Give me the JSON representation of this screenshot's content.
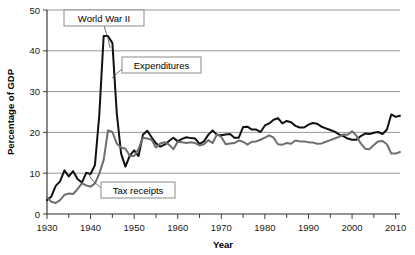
{
  "chart_data": {
    "type": "line",
    "title": "",
    "xlabel": "Year",
    "ylabel": "Percentage of GDP",
    "xlim": [
      1930,
      2011
    ],
    "ylim": [
      0,
      50
    ],
    "grid": true,
    "legend_position": "inline-annotations",
    "x_ticks_labeled": [
      1930,
      1940,
      1950,
      1960,
      1970,
      1980,
      1990,
      2000,
      2010
    ],
    "x_tick_labels": [
      "1930",
      "1940",
      "1950",
      "1960",
      "1970",
      "1980",
      "1990",
      "2000",
      "2010"
    ],
    "x_minor_ticks": [
      1935,
      1945,
      1955,
      1965,
      1975,
      1985,
      1995,
      2005
    ],
    "y_ticks": [
      0,
      10,
      20,
      30,
      40,
      50
    ],
    "y_tick_labels": [
      "0",
      "10",
      "20",
      "30",
      "40",
      "50"
    ],
    "annotations": [
      {
        "name": "world-war-ii",
        "text": "World War II",
        "box_x": 64,
        "box_y": 10,
        "box_w": 80,
        "box_h": 16,
        "leader": "M 104 26 L 108 38 L 110 48"
      },
      {
        "name": "expenditures",
        "text": "Expenditures",
        "box_x": 122,
        "box_y": 57,
        "box_w": 79,
        "box_h": 16,
        "leader": "M 122 69 L 112 78"
      },
      {
        "name": "tax-receipts",
        "text": "Tax receipts",
        "box_x": 101,
        "box_y": 182,
        "box_w": 74,
        "box_h": 16,
        "leader": "M 101 188 L 92 180 L 88 173"
      }
    ],
    "series": [
      {
        "name": "Expenditures",
        "color": "#111111",
        "width": 2.0,
        "x": [
          1930,
          1931,
          1932,
          1933,
          1934,
          1935,
          1936,
          1937,
          1938,
          1939,
          1940,
          1941,
          1942,
          1943,
          1944,
          1945,
          1946,
          1947,
          1948,
          1949,
          1950,
          1951,
          1952,
          1953,
          1954,
          1955,
          1956,
          1957,
          1958,
          1959,
          1960,
          1961,
          1962,
          1963,
          1964,
          1965,
          1966,
          1967,
          1968,
          1969,
          1970,
          1971,
          1972,
          1973,
          1974,
          1975,
          1976,
          1977,
          1978,
          1979,
          1980,
          1981,
          1982,
          1983,
          1984,
          1985,
          1986,
          1987,
          1988,
          1989,
          1990,
          1991,
          1992,
          1993,
          1994,
          1995,
          1996,
          1997,
          1998,
          1999,
          2000,
          2001,
          2002,
          2003,
          2004,
          2005,
          2006,
          2007,
          2008,
          2009,
          2010,
          2011
        ],
        "values": [
          3.4,
          4.3,
          6.9,
          8.0,
          10.7,
          9.2,
          10.5,
          8.6,
          7.7,
          10.1,
          9.8,
          12.0,
          24.3,
          43.6,
          43.6,
          41.9,
          24.8,
          14.8,
          11.6,
          14.3,
          15.6,
          14.2,
          19.4,
          20.4,
          18.8,
          17.3,
          16.5,
          17.0,
          17.9,
          18.7,
          17.8,
          18.4,
          18.8,
          18.6,
          18.5,
          17.2,
          17.8,
          19.4,
          20.5,
          19.4,
          19.3,
          19.5,
          19.6,
          18.7,
          18.7,
          21.3,
          21.4,
          20.7,
          20.7,
          20.1,
          21.7,
          22.2,
          23.1,
          23.5,
          22.2,
          22.8,
          22.5,
          21.6,
          21.2,
          21.2,
          21.9,
          22.3,
          22.1,
          21.4,
          21.0,
          20.6,
          20.2,
          19.5,
          19.1,
          18.5,
          18.2,
          18.2,
          19.1,
          19.7,
          19.6,
          19.9,
          20.1,
          19.6,
          20.7,
          24.4,
          23.8,
          24.1
        ]
      },
      {
        "name": "Tax receipts",
        "color": "#6e6e6e",
        "width": 2.0,
        "x": [
          1930,
          1931,
          1932,
          1933,
          1934,
          1935,
          1936,
          1937,
          1938,
          1939,
          1940,
          1941,
          1942,
          1943,
          1944,
          1945,
          1946,
          1947,
          1948,
          1949,
          1950,
          1951,
          1952,
          1953,
          1954,
          1955,
          1956,
          1957,
          1958,
          1959,
          1960,
          1961,
          1962,
          1963,
          1964,
          1965,
          1966,
          1967,
          1968,
          1969,
          1970,
          1971,
          1972,
          1973,
          1974,
          1975,
          1976,
          1977,
          1978,
          1979,
          1980,
          1981,
          1982,
          1983,
          1984,
          1985,
          1986,
          1987,
          1988,
          1989,
          1990,
          1991,
          1992,
          1993,
          1994,
          1995,
          1996,
          1997,
          1998,
          1999,
          2000,
          2001,
          2002,
          2003,
          2004,
          2005,
          2006,
          2007,
          2008,
          2009,
          2010,
          2011
        ],
        "values": [
          4.1,
          3.0,
          2.7,
          3.4,
          4.7,
          5.0,
          4.9,
          6.1,
          7.5,
          7.0,
          6.7,
          7.5,
          9.9,
          13.2,
          20.5,
          20.1,
          17.3,
          16.3,
          16.0,
          14.3,
          14.2,
          15.9,
          18.7,
          18.5,
          18.2,
          16.3,
          17.3,
          17.6,
          17.0,
          15.9,
          17.7,
          17.6,
          17.4,
          17.6,
          17.4,
          16.8,
          17.1,
          18.1,
          17.4,
          19.5,
          18.9,
          17.1,
          17.3,
          17.4,
          18.0,
          17.7,
          17.0,
          17.7,
          17.8,
          18.2,
          18.7,
          19.3,
          18.7,
          17.1,
          17.0,
          17.4,
          17.2,
          18.0,
          17.8,
          17.8,
          17.6,
          17.5,
          17.2,
          17.3,
          17.7,
          18.1,
          18.5,
          18.9,
          19.5,
          19.4,
          20.3,
          19.2,
          17.3,
          16.0,
          15.9,
          16.9,
          17.8,
          17.9,
          17.1,
          14.8,
          14.8,
          15.2
        ]
      }
    ]
  },
  "layout": {
    "plot_left": 47,
    "plot_right": 400,
    "plot_top": 10,
    "plot_bottom": 214
  }
}
